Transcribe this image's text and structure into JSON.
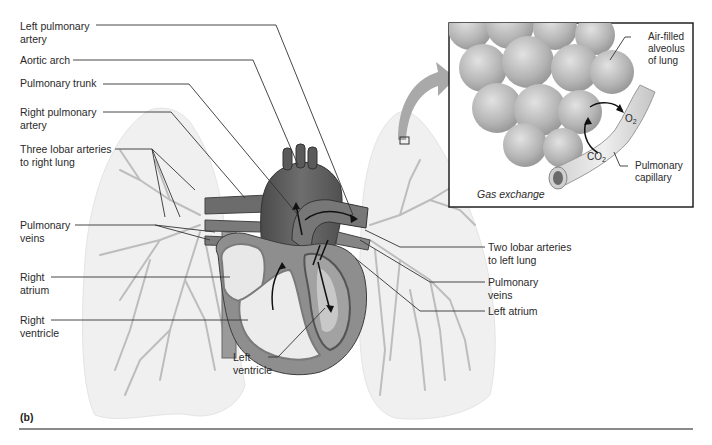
{
  "figure": {
    "panel_label": "(b)",
    "colors": {
      "lung_fill": "#f0f0f0",
      "vessel": "#b8b8b8",
      "heart_dark": "#5a5a5a",
      "heart_mid": "#8a8a8a",
      "heart_light": "#e6e6e6",
      "leader_line": "#333333",
      "arrow_gray": "#a8a8a8"
    }
  },
  "labels_left": [
    {
      "line1": "Left pulmonary",
      "line2": "artery"
    },
    {
      "line1": "Aortic arch",
      "line2": ""
    },
    {
      "line1": "Pulmonary trunk",
      "line2": ""
    },
    {
      "line1": "Right pulmonary",
      "line2": "artery"
    },
    {
      "line1": "Three lobar arteries",
      "line2": "to right lung"
    },
    {
      "line1": "Pulmonary",
      "line2": "veins"
    },
    {
      "line1": "Right",
      "line2": "atrium"
    },
    {
      "line1": "Right",
      "line2": "ventricle"
    }
  ],
  "labels_bottom": [
    {
      "line1": "Left",
      "line2": "ventricle"
    }
  ],
  "labels_right": [
    {
      "line1": "Two lobar arteries",
      "line2": "to left lung"
    },
    {
      "line1": "Pulmonary",
      "line2": "veins"
    },
    {
      "line1": "Left atrium",
      "line2": ""
    }
  ],
  "inset": {
    "caption": "Gas exchange",
    "labels": [
      {
        "line1": "Air-filled",
        "line2": "alveolus",
        "line3": "of lung"
      },
      {
        "line1": "Pulmonary",
        "line2": "capillary"
      }
    ],
    "gases": [
      {
        "base": "O",
        "sub": "2"
      },
      {
        "base": "CO",
        "sub": "2"
      }
    ]
  }
}
